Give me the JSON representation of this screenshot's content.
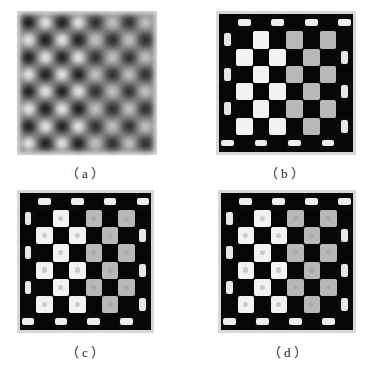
{
  "figure": {
    "panels": [
      {
        "id": "a",
        "label": "（a）",
        "style": "smooth-gradient",
        "grid": "8x8",
        "top_left": "dark",
        "description": "blurred periodic grayscale pattern of bright and dark blobs"
      },
      {
        "id": "b",
        "label": "（b）",
        "style": "sharp-checkerboard",
        "grid": "8x8",
        "top_left": "dark",
        "description": "binary-like checkerboard with bar-shaped edge cells"
      },
      {
        "id": "c",
        "label": "（c）",
        "style": "sharp-checkerboard-ringed",
        "grid": "8x8",
        "top_left": "dark",
        "description": "checkerboard with ring artifacts inside light cells"
      },
      {
        "id": "d",
        "label": "（d）",
        "style": "sharp-checkerboard-ringed",
        "grid": "8x8",
        "top_left": "dark",
        "description": "checkerboard with textured light cells and bracket edge cells"
      }
    ],
    "colors": {
      "dark": "#060606",
      "light": "#f2f2f2",
      "grey_light": "#b8b8b8",
      "frame": "#d8d8d8",
      "background": "#ffffff"
    }
  }
}
